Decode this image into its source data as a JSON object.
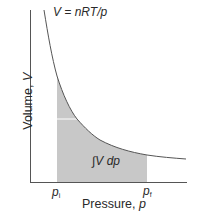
{
  "diagram": {
    "equation_label": "V = nRT/p",
    "integral_label": {
      "symbol": "∫",
      "var": "V",
      "rest": " dp"
    },
    "x_axis_label_text": "Pressure, ",
    "x_axis_label_var": "p",
    "y_axis_label_text": "Volume, ",
    "y_axis_label_var": "V",
    "p_initial": {
      "base": "p",
      "sub": "i"
    },
    "p_final": {
      "base": "p",
      "sub": "f"
    },
    "colors": {
      "axis": "#555555",
      "curve": "#555555",
      "shade": "#c8c8c8",
      "text": "#2a2a2a",
      "background": "#ffffff"
    }
  }
}
